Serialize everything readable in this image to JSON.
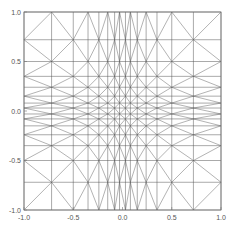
{
  "chart_data": {
    "type": "line",
    "title": "",
    "xlabel": "",
    "ylabel": "",
    "xlim": [
      -1.0,
      1.0
    ],
    "ylim": [
      -1.0,
      1.0
    ],
    "grid": false,
    "legend": null,
    "nodes": [
      -1.0,
      -0.72,
      -0.5,
      -0.35,
      -0.24,
      -0.15,
      -0.08,
      -0.03,
      0.03,
      0.08,
      0.15,
      0.24,
      0.35,
      0.5,
      0.72,
      1.0
    ],
    "x_ticks": [
      {
        "value": -1.0,
        "label": "-1.0"
      },
      {
        "value": -0.5,
        "label": "-0.5"
      },
      {
        "value": 0.0,
        "label": "0.0"
      },
      {
        "value": 0.5,
        "label": "0.5"
      },
      {
        "value": 1.0,
        "label": "1.0"
      }
    ],
    "y_ticks": [
      {
        "value": -1.0,
        "label": "-1.0"
      },
      {
        "value": -0.5,
        "label": "-0.5"
      },
      {
        "value": 0.0,
        "label": "0.0"
      },
      {
        "value": 0.5,
        "label": "0.5"
      },
      {
        "value": 1.0,
        "label": "1.0"
      }
    ],
    "line_color": "#555555"
  }
}
